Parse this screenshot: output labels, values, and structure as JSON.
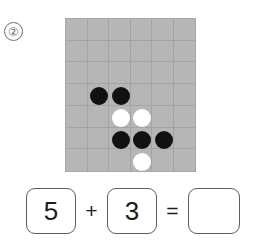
{
  "problem": {
    "number_label": "②"
  },
  "board": {
    "columns": 6,
    "rows": 7,
    "background_color": "#b6b6b6",
    "gridline_color": "#a3a3a3",
    "black_stone_color": "#111111",
    "white_stone_color": "#ffffff",
    "black_count": 5,
    "white_count": 3,
    "stones": [
      {
        "name": "stone-black-1",
        "color": "black",
        "col": 2,
        "row": 4
      },
      {
        "name": "stone-black-2",
        "color": "black",
        "col": 3,
        "row": 4
      },
      {
        "name": "stone-white-1",
        "color": "white",
        "col": 3,
        "row": 5
      },
      {
        "name": "stone-white-2",
        "color": "white",
        "col": 4,
        "row": 5
      },
      {
        "name": "stone-black-3",
        "color": "black",
        "col": 3,
        "row": 6
      },
      {
        "name": "stone-black-4",
        "color": "black",
        "col": 4,
        "row": 6
      },
      {
        "name": "stone-black-5",
        "color": "black",
        "col": 5,
        "row": 6
      },
      {
        "name": "stone-white-3",
        "color": "white",
        "col": 4,
        "row": 7
      }
    ]
  },
  "equation": {
    "first_operand": "5",
    "operator_plus": "+",
    "second_operand": "3",
    "operator_equals": "=",
    "answer": ""
  }
}
